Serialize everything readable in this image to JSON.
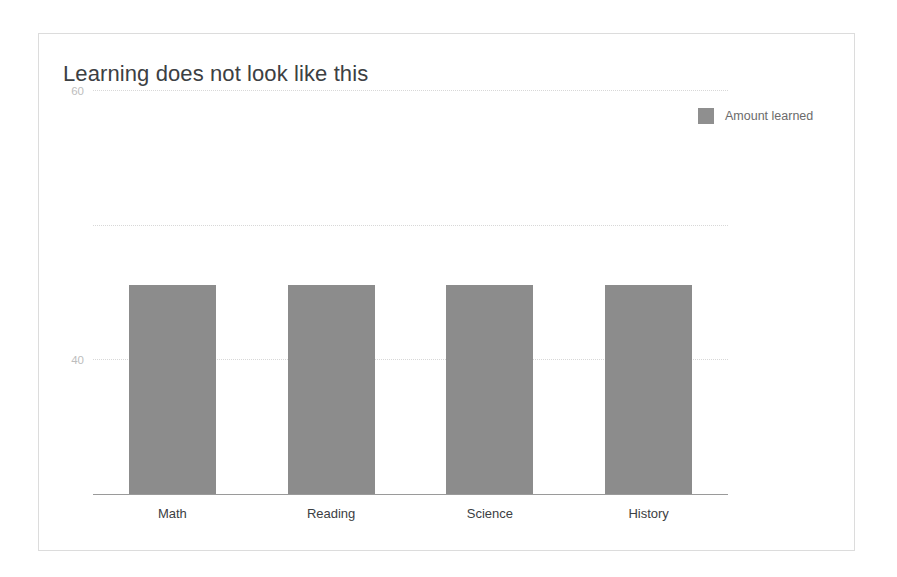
{
  "card": {
    "background": "#ffffff",
    "border_color": "#dcdcdc"
  },
  "chart_data": {
    "type": "bar",
    "title": "Learning does not look like this",
    "xlabel": "",
    "ylabel": "",
    "categories": [
      "Math",
      "Reading",
      "Science",
      "History"
    ],
    "series": [
      {
        "name": "Amount learned",
        "color": "#8c8c8c",
        "values": [
          31,
          31,
          31,
          31
        ]
      }
    ],
    "ylim": [
      0,
      60
    ],
    "yticks": [
      0,
      20,
      40,
      60
    ],
    "ytick_labels": [
      "0",
      "20",
      "40",
      "60"
    ],
    "grid": true,
    "gridline_color": "#d8d8d8",
    "axis_color": "#9a9a9a",
    "legend": {
      "position": "top-right",
      "entries": [
        {
          "label": "Amount learned",
          "color": "#8f8f8f"
        }
      ]
    },
    "tick_label_color": "#bdbdbd",
    "category_label_color": "#3c4043",
    "title_color": "#3c4043"
  }
}
